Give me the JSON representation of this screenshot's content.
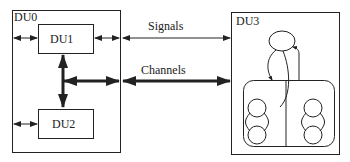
{
  "diagram": {
    "units": {
      "du0": {
        "label": "DU0"
      },
      "du1": {
        "label": "DU1"
      },
      "du2": {
        "label": "DU2"
      },
      "du3": {
        "label": "DU3"
      }
    },
    "connections": {
      "signals": {
        "label": "Signals"
      },
      "channels": {
        "label": "Channels"
      }
    },
    "colors": {
      "stroke": "#222222",
      "background": "#ffffff"
    }
  }
}
